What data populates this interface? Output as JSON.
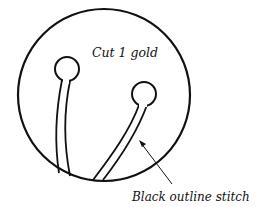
{
  "diagram": {
    "type": "sewing-pattern-piece",
    "labels": {
      "cut_instruction": "Cut 1 gold",
      "stitch_callout": "Black outline stitch"
    },
    "colors": {
      "stroke": "#111111",
      "background": "#ffffff"
    },
    "shapes": {
      "outer_circle": {
        "cx": 104,
        "cy": 95,
        "r": 86
      },
      "left_knob": {
        "cx": 67,
        "cy": 69,
        "r": 12
      },
      "right_knob": {
        "cx": 144,
        "cy": 94,
        "r": 12
      }
    }
  }
}
